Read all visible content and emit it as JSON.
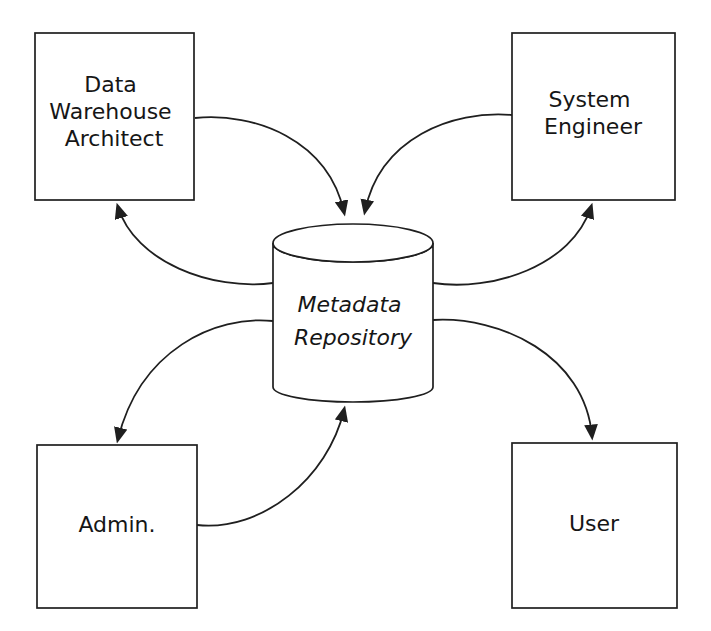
{
  "diagram": {
    "type": "hub-and-spoke",
    "colors": {
      "background": "#ffffff",
      "stroke": "#1f1f1f",
      "node_fill": "#ffffff",
      "text": "#161616"
    },
    "nodes": {
      "data_warehouse_architect": {
        "shape": "rectangle",
        "lines": [
          "Data",
          "Warehouse",
          "Architect"
        ]
      },
      "system_engineer": {
        "shape": "rectangle",
        "lines": [
          "System",
          "Engineer"
        ]
      },
      "admin": {
        "shape": "rectangle",
        "label": "Admin."
      },
      "user": {
        "shape": "rectangle",
        "label": "User"
      },
      "metadata_repository": {
        "shape": "cylinder",
        "lines": [
          "Metadata",
          "Repository"
        ]
      }
    },
    "edges": [
      {
        "from": "Data Warehouse Architect",
        "to": "Metadata Repository",
        "arrow": "into repository top"
      },
      {
        "from": "Metadata Repository",
        "to": "Data Warehouse Architect",
        "arrow": "into box bottom"
      },
      {
        "from": "System Engineer",
        "to": "Metadata Repository",
        "arrow": "into repository top"
      },
      {
        "from": "Metadata Repository",
        "to": "System Engineer",
        "arrow": "into box bottom"
      },
      {
        "from": "Metadata Repository",
        "to": "Admin.",
        "arrow": "into box top"
      },
      {
        "from": "Admin.",
        "to": "Metadata Repository",
        "arrow": "into repository bottom"
      },
      {
        "from": "Metadata Repository",
        "to": "User",
        "arrow": "into box top"
      }
    ]
  }
}
